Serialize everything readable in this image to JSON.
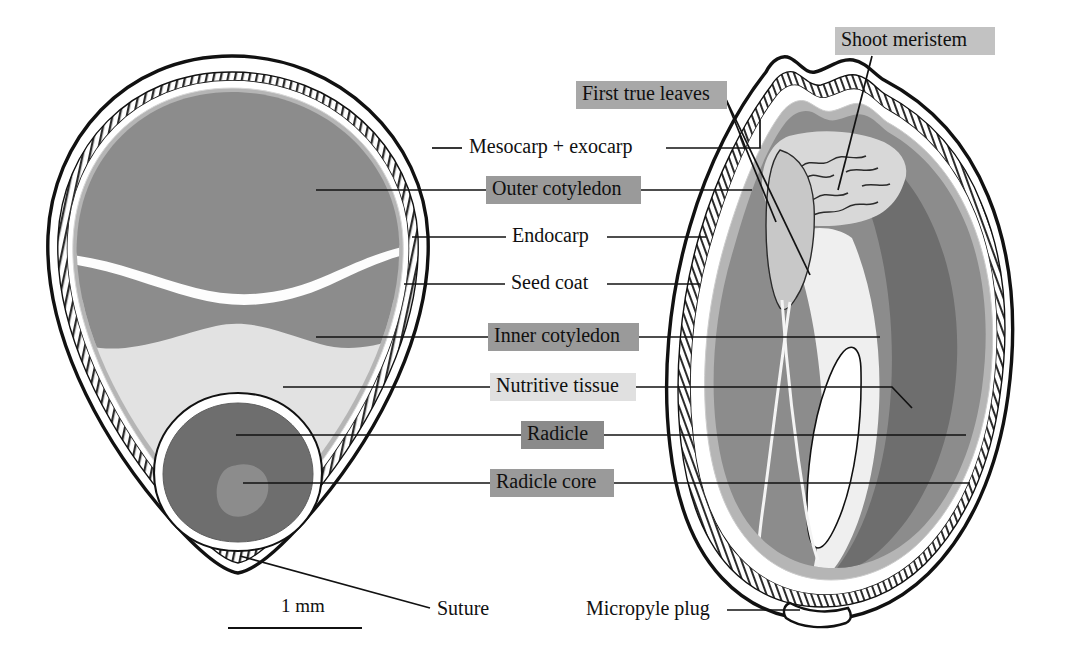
{
  "figure": {
    "scale_bar": {
      "label": "1 mm"
    }
  },
  "colors": {
    "outer_cotyledon_fill": "#8c8c8c",
    "inner_cotyledon_fill": "#8c8c8c",
    "nutritive_tissue_fill": "#e2e2e2",
    "radicle_fill": "#6e6e6e",
    "radicle_core_fill": "#8c8c8c",
    "endocarp_fill": "#ffffff",
    "seed_coat_fill": "#b5b5b5",
    "shoot_meristem_fill": "#d0d0d0",
    "stroke": "#111111",
    "badge_dark": "#9a9a9a",
    "badge_mid": "#b0b0b0",
    "badge_light": "#e0e0e0",
    "badge_darker": "#8a8a8a"
  },
  "labels": [
    {
      "id": "mesocarp-exocarp",
      "text": "Mesocarp + exocarp",
      "badge": false,
      "badge_color": "",
      "text_x": 469,
      "text_y": 148,
      "text_width": 189,
      "align": "left"
    },
    {
      "id": "outer-cotyledon",
      "text": "Outer cotyledon",
      "badge": true,
      "badge_color": "#9a9a9a",
      "text_x": 492,
      "text_y": 190,
      "text_width": 143,
      "align": "left"
    },
    {
      "id": "endocarp",
      "text": "Endocarp",
      "badge": false,
      "badge_color": "",
      "text_x": 512,
      "text_y": 237,
      "text_width": 89,
      "align": "left"
    },
    {
      "id": "seed-coat",
      "text": "Seed coat",
      "badge": false,
      "badge_color": "",
      "text_x": 511,
      "text_y": 284,
      "text_width": 90,
      "align": "left"
    },
    {
      "id": "inner-cotyledon",
      "text": "Inner cotyledon",
      "badge": true,
      "badge_color": "#9a9a9a",
      "text_x": 494,
      "text_y": 337,
      "text_width": 139,
      "align": "left"
    },
    {
      "id": "nutritive-tissue",
      "text": "Nutritive tissue",
      "badge": true,
      "badge_color": "#e0e0e0",
      "text_x": 496,
      "text_y": 387,
      "text_width": 134,
      "align": "left"
    },
    {
      "id": "radicle",
      "text": "Radicle",
      "badge": true,
      "badge_color": "#8a8a8a",
      "text_x": 527,
      "text_y": 435,
      "text_width": 71,
      "align": "left"
    },
    {
      "id": "radicle-core",
      "text": "Radicle core",
      "badge": true,
      "badge_color": "#9a9a9a",
      "text_x": 496,
      "text_y": 483,
      "text_width": 112,
      "align": "left"
    },
    {
      "id": "shoot-meristem",
      "text": "Shoot meristem",
      "badge": true,
      "badge_color": "#c2c2c2",
      "text_x": 841,
      "text_y": 41,
      "text_width": 148,
      "align": "left"
    },
    {
      "id": "first-true-leaves",
      "text": "First true leaves",
      "badge": true,
      "badge_color": "#a8a8a8",
      "text_x": 582,
      "text_y": 95,
      "text_width": 139,
      "align": "left"
    },
    {
      "id": "suture",
      "text": "Suture",
      "badge": false,
      "badge_color": "",
      "text_x": 437,
      "text_y": 610,
      "text_width": 61,
      "align": "left"
    },
    {
      "id": "micropyle-plug",
      "text": "Micropyle plug",
      "badge": false,
      "badge_color": "",
      "text_x": 586,
      "text_y": 610,
      "text_width": 137,
      "align": "left"
    }
  ]
}
